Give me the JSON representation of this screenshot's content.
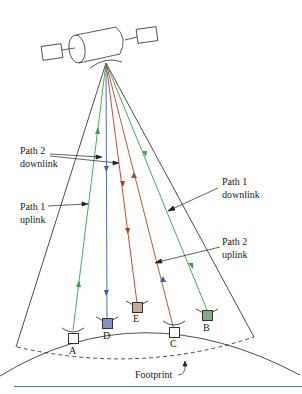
{
  "diagram": {
    "labels": {
      "path2_downlink": "Path 2\ndownlink",
      "path1_uplink": "Path 1\nuplink",
      "path1_downlink": "Path 1\ndownlink",
      "path2_uplink": "Path 2\nuplink",
      "footprint": "Footprint"
    },
    "stations": [
      {
        "id": "A",
        "fill": "#ffffff"
      },
      {
        "id": "D",
        "fill": "#8a8fc4"
      },
      {
        "id": "E",
        "fill": "#c9a89a"
      },
      {
        "id": "C",
        "fill": "#ffffff"
      },
      {
        "id": "B",
        "fill": "#7fae86"
      }
    ],
    "colors": {
      "path1": "#3aa053",
      "path2_down": "#c0392b",
      "blue": "#3e5fa8",
      "rule": "#4a7ab0"
    }
  }
}
